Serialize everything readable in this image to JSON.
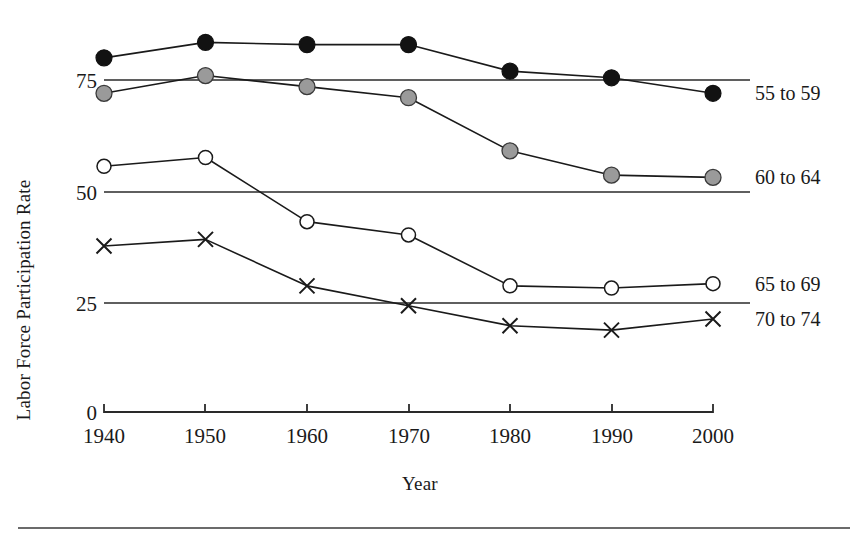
{
  "chart_data": {
    "type": "line",
    "title": "",
    "xlabel": "Year",
    "ylabel": "Labor Force Participation Rate",
    "x": [
      1940,
      1950,
      1960,
      1970,
      1980,
      1990,
      2000
    ],
    "xtick_labels": [
      "1940",
      "1950",
      "1960",
      "1970",
      "1980",
      "1990",
      "2000"
    ],
    "ytick_labels": [
      "0",
      "25",
      "50",
      "75"
    ],
    "yticks": [
      0,
      25,
      50,
      75
    ],
    "ylim": [
      0,
      93
    ],
    "xlim": [
      1940,
      2000
    ],
    "grid": "horizontal gridlines at 25, 50 and 75",
    "legend_position": "right-of-line-ends",
    "series": [
      {
        "name": "55 to 59",
        "label": "55 to 59",
        "marker": "filled-black-circle",
        "color": "#121212",
        "values": [
          80,
          83.5,
          83,
          83,
          77,
          75.5,
          72
        ]
      },
      {
        "name": "60 to 64",
        "label": "60 to 64",
        "marker": "filled-gray-circle",
        "color": "#9a9a9a",
        "values": [
          72,
          76,
          73.5,
          71,
          59,
          53.5,
          53
        ]
      },
      {
        "name": "65 to 69",
        "label": "65 to 69",
        "marker": "open-circle",
        "color": "#ffffff",
        "values": [
          55.5,
          57.5,
          43,
          40,
          28.5,
          28,
          29
        ]
      },
      {
        "name": "70 to 74",
        "label": "70 to 74",
        "marker": "cross",
        "color": "#1a1a1a",
        "values": [
          37.5,
          39,
          28.5,
          24,
          19.5,
          18.5,
          21
        ]
      }
    ]
  }
}
